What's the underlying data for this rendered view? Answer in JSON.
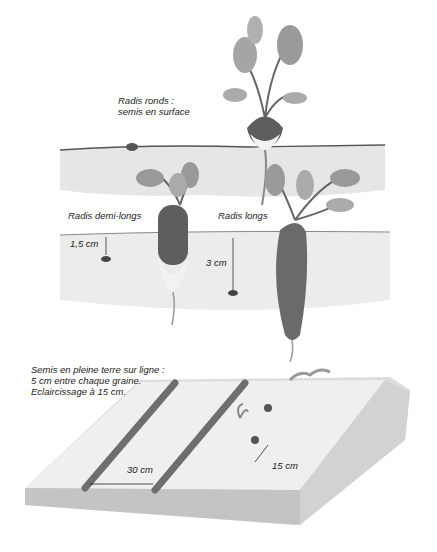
{
  "figure": {
    "top_section": {
      "labels": {
        "round_line1": "Radis ronds :",
        "round_line2": "semis en surface",
        "half_long": "Radis demi-longs",
        "long": "Radis longs",
        "depth_half_long": "1,5 cm",
        "depth_long": "3 cm"
      }
    },
    "bottom_section": {
      "labels": {
        "line1": "Semis en pleine terre sur ligne :",
        "line2": "5 cm entre chaque graine.",
        "line3": "Eclaircissage à 15 cm.",
        "row_spacing": "30 cm",
        "thinning_spacing": "15 cm"
      }
    },
    "colors": {
      "soil": "#e4e4e4",
      "soil_dark": "#bdbdbd",
      "root": "#6e6e6e",
      "leaf": "#9a9a9a",
      "text": "#222222"
    }
  }
}
